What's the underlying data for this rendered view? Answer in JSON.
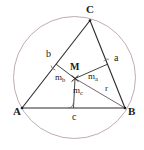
{
  "figure": {
    "type": "geometry-diagram",
    "background_color": "#ffffff",
    "colors": {
      "circle_stroke": "#b9a2aa",
      "triangle_stroke": "#2b2b2b",
      "bisector_stroke": "#3a3a3a",
      "radius_stroke": "#6b5560",
      "right_angle_stroke": "#7a6068",
      "label_fill": "#1a1a1a"
    },
    "circle": {
      "label": "circumcircle",
      "cx": 74.5,
      "cy": 77.5,
      "r": 61.0
    },
    "points": [
      {
        "name": "A",
        "label": "A",
        "x": 22.0,
        "y": 108.0,
        "label_x": 13.0,
        "label_y": 115.0
      },
      {
        "name": "B",
        "label": "B",
        "x": 125.0,
        "y": 108.0,
        "label_x": 128.0,
        "label_y": 115.0
      },
      {
        "name": "C",
        "label": "C",
        "x": 90.0,
        "y": 20.5,
        "label_x": 86.0,
        "label_y": 13.0
      },
      {
        "name": "M",
        "label": "M",
        "x": 75.0,
        "y": 78.5,
        "label_x": 70.0,
        "label_y": 70.0
      }
    ],
    "side_labels": [
      {
        "name": "side-a",
        "label": "a",
        "x": 114.0,
        "y": 61.0
      },
      {
        "name": "side-b",
        "label": "b",
        "x": 46.0,
        "y": 57.0
      },
      {
        "name": "side-c",
        "label": "c",
        "x": 72.0,
        "y": 120.0
      }
    ],
    "bisector_labels": [
      {
        "name": "m-a",
        "base": "m",
        "sub": "a",
        "x": 88.0,
        "y": 79.0
      },
      {
        "name": "m-b",
        "base": "m",
        "sub": "b",
        "x": 55.0,
        "y": 80.0
      },
      {
        "name": "m-c",
        "base": "m",
        "sub": "c",
        "x": 73.0,
        "y": 93.0
      }
    ],
    "radius_label": {
      "name": "radius-r",
      "label": "r",
      "x": 105.0,
      "y": 91.0
    },
    "segments": [
      {
        "name": "side-AB",
        "x1": 22.0,
        "y1": 108.0,
        "x2": 125.0,
        "y2": 108.0
      },
      {
        "name": "side-AC",
        "x1": 22.0,
        "y1": 108.0,
        "x2": 90.0,
        "y2": 20.5
      },
      {
        "name": "side-BC",
        "x1": 125.0,
        "y1": 108.0,
        "x2": 90.0,
        "y2": 20.5
      },
      {
        "name": "bisector-ma",
        "x1": 75.0,
        "y1": 78.5,
        "x2": 107.5,
        "y2": 64.2
      },
      {
        "name": "bisector-mb",
        "x1": 75.0,
        "y1": 78.5,
        "x2": 56.0,
        "y2": 64.2
      },
      {
        "name": "bisector-mc",
        "x1": 75.0,
        "y1": 78.5,
        "x2": 73.5,
        "y2": 108.0
      },
      {
        "name": "radius-MB",
        "x1": 75.0,
        "y1": 78.5,
        "x2": 125.0,
        "y2": 108.0
      }
    ],
    "right_angle_marks": [
      {
        "name": "right-angle-at-a",
        "cx": 107.5,
        "cy": 64.2
      },
      {
        "name": "right-angle-at-b",
        "cx": 56.0,
        "cy": 64.2
      },
      {
        "name": "right-angle-at-c",
        "cx": 73.5,
        "cy": 108.0
      }
    ]
  }
}
